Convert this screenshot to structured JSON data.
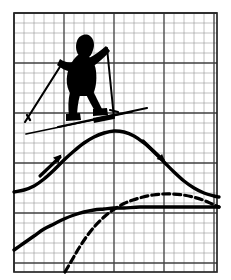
{
  "figure": {
    "width": 231,
    "height": 280,
    "background_color": "#ffffff",
    "ink_color": "#000000"
  },
  "grid": {
    "name": "graph-paper-grid",
    "x": 14,
    "y": 13,
    "width": 203,
    "height": 259,
    "cell_size": 10,
    "columns": 20,
    "rows": 26,
    "minor_color": "#8c8c8c",
    "minor_width": 0.55,
    "major_color": "#3a3a3a",
    "major_width": 1.25,
    "major_every": 5,
    "border_color": "#2a2a2a",
    "border_width": 1.6
  },
  "chart_data": {
    "type": "line",
    "subtitle": "",
    "xlabel": "",
    "ylabel": "",
    "grid": true,
    "legend": "none",
    "xlim": [
      14,
      217
    ],
    "ylim": [
      272,
      13
    ],
    "series": [
      {
        "name": "bell-curve-solid",
        "style": "solid",
        "stroke_width": 3.4,
        "annotation": "arrowheads on ascending and descending flanks",
        "points": [
          [
            14,
            192
          ],
          [
            24,
            190
          ],
          [
            34,
            186
          ],
          [
            44,
            179
          ],
          [
            54,
            170
          ],
          [
            64,
            160
          ],
          [
            74,
            151
          ],
          [
            84,
            143
          ],
          [
            94,
            137
          ],
          [
            104,
            133
          ],
          [
            114,
            131
          ],
          [
            124,
            132
          ],
          [
            134,
            136
          ],
          [
            144,
            143
          ],
          [
            154,
            152
          ],
          [
            164,
            162
          ],
          [
            174,
            172
          ],
          [
            184,
            181
          ],
          [
            194,
            188
          ],
          [
            204,
            193
          ],
          [
            214,
            196
          ],
          [
            219,
            197
          ]
        ]
      },
      {
        "name": "saturating-curve-solid",
        "style": "solid",
        "stroke_width": 3.4,
        "annotation": "rises from lower left and flattens to a plateau",
        "points": [
          [
            14,
            250
          ],
          [
            24,
            243
          ],
          [
            34,
            236
          ],
          [
            44,
            229
          ],
          [
            54,
            224
          ],
          [
            64,
            219
          ],
          [
            74,
            215
          ],
          [
            84,
            212
          ],
          [
            94,
            210
          ],
          [
            104,
            209
          ],
          [
            114,
            208
          ],
          [
            124,
            208
          ],
          [
            140,
            207
          ],
          [
            160,
            207
          ],
          [
            180,
            207
          ],
          [
            200,
            207
          ],
          [
            219,
            207
          ]
        ]
      },
      {
        "name": "bell-curve-dashed",
        "style": "dashed",
        "stroke_width": 3.2,
        "dash_pattern": "7 4",
        "annotation": "dashed hump peaking right of centre",
        "points": [
          [
            65,
            272
          ],
          [
            72,
            260
          ],
          [
            79,
            248
          ],
          [
            87,
            236
          ],
          [
            95,
            226
          ],
          [
            104,
            217
          ],
          [
            113,
            210
          ],
          [
            123,
            204
          ],
          [
            133,
            200
          ],
          [
            143,
            197
          ],
          [
            153,
            195
          ],
          [
            163,
            194
          ],
          [
            173,
            194
          ],
          [
            183,
            195
          ],
          [
            193,
            197
          ],
          [
            203,
            200
          ],
          [
            212,
            204
          ],
          [
            219,
            207
          ]
        ]
      }
    ],
    "annotations": [
      {
        "name": "up-arrow-marker",
        "kind": "arrowhead",
        "direction": "up-right",
        "x": 56,
        "y": 156
      },
      {
        "name": "down-arrow-marker",
        "kind": "arrowhead",
        "direction": "down-right",
        "x": 160,
        "y": 158
      }
    ]
  },
  "skier": {
    "name": "skier-silhouette",
    "description": "Cross-country skier silhouette in black, mid-stride with two poles and skis",
    "parts": [
      "hood",
      "head",
      "torso",
      "left-arm",
      "right-arm",
      "left-leg",
      "right-leg",
      "left-pole",
      "right-pole",
      "front-ski",
      "rear-ski"
    ],
    "color": "#000000",
    "bounds": {
      "x": 24,
      "y": 35,
      "width": 120,
      "height": 100
    }
  }
}
